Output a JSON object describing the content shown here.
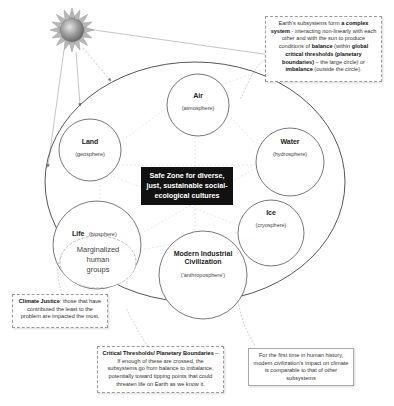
{
  "diagram": {
    "sun": {
      "icon": "sun-icon"
    },
    "outer_boundary": {
      "label": "Planetary boundary (large circle)"
    },
    "center": {
      "lines": [
        "Safe Zone for diverse,",
        "just, sustainable social-",
        "ecological cultures"
      ]
    },
    "subsystems": [
      {
        "id": "air",
        "title": "Air",
        "subtitle": "(atmosphere)"
      },
      {
        "id": "land",
        "title": "Land",
        "subtitle": "(geosphere)"
      },
      {
        "id": "water",
        "title": "Water",
        "subtitle": "(hydrosphere)"
      },
      {
        "id": "ice",
        "title": "Ice",
        "subtitle": "(cryosphere)"
      },
      {
        "id": "life",
        "title": "Life",
        "subtitle": "(biosphere)"
      },
      {
        "id": "civ",
        "title_lines": [
          "Modern Industrial",
          "Civilization"
        ],
        "subtitle": "('anthroposphere')"
      }
    ],
    "marginalized": {
      "lines": [
        "Marginalized",
        "human",
        "groups"
      ]
    },
    "notes": {
      "complex_system": {
        "parts": [
          {
            "t": "Earth's subsystems form ",
            "b": false
          },
          {
            "t": "a complex system",
            "b": true
          },
          {
            "t": " - interacting non-linearly with each other and with the sun to produce conditions of ",
            "b": false
          },
          {
            "t": "balance",
            "b": true
          },
          {
            "t": " (within ",
            "b": false
          },
          {
            "t": "global critical thresholds (planetary boundaries)",
            "b": true
          },
          {
            "t": " – the large circle) or ",
            "b": false
          },
          {
            "t": "imbalance",
            "b": true
          },
          {
            "t": " (outside the circle).",
            "b": false
          }
        ]
      },
      "climate_justice": {
        "bold": "Climate Justice",
        "text": ": those that have contributed the least to the problem are impacted the most."
      },
      "thresholds": {
        "bold": "Critical Thresholds/ Planetary Boundaries",
        "text": " – If enough of these are crossed, the subsystems go from balance to imbalance, potentially toward tipping points that could threaten life on Earth as we know it."
      },
      "first_time": {
        "text": "For the first time in human history, modern civilization's impact on climate is comparable to that of other subsystems"
      }
    }
  }
}
